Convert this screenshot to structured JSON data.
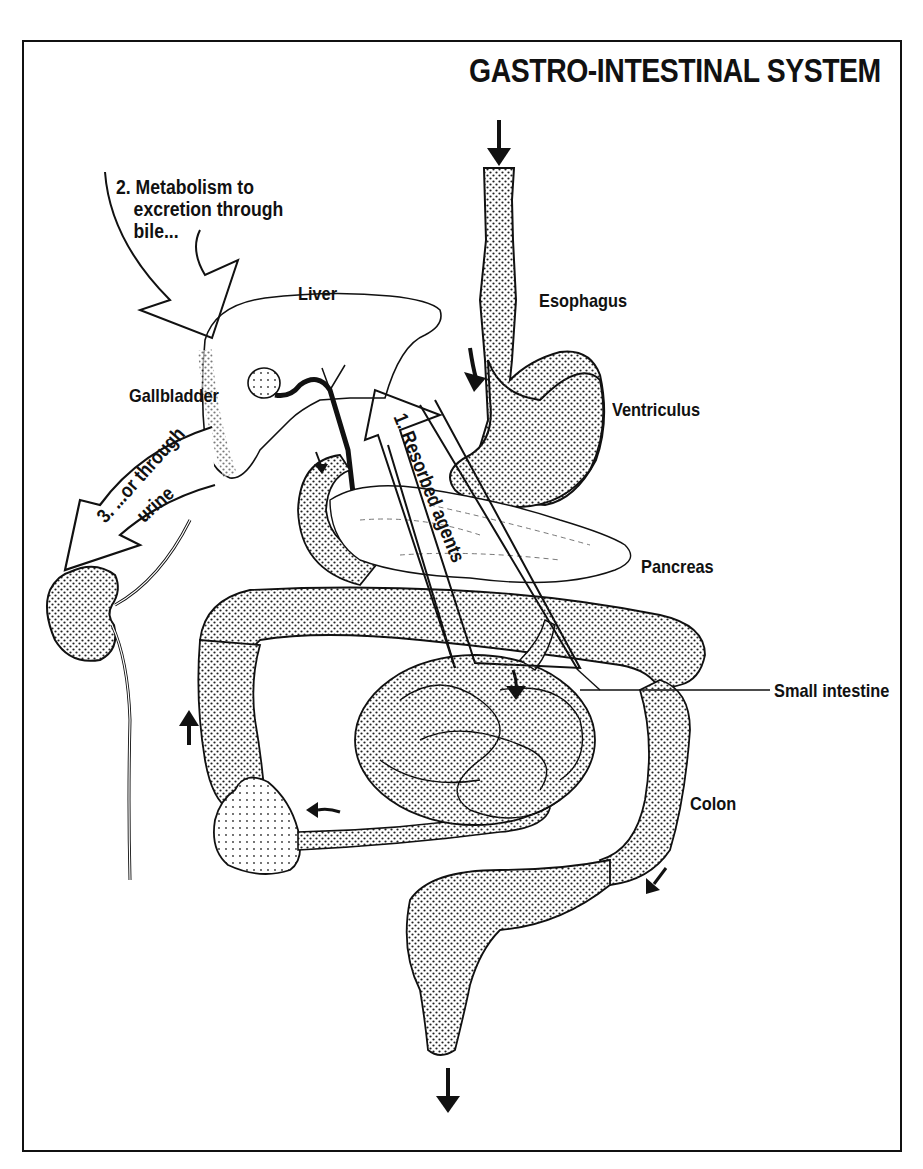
{
  "title": "GASTRO-INTESTINAL SYSTEM",
  "labels": {
    "liver": "Liver",
    "gallbladder": "Gallbladder",
    "esophagus": "Esophagus",
    "ventriculus": "Ventriculus",
    "pancreas": "Pancreas",
    "small_intestine": "Small intestine",
    "colon": "Colon"
  },
  "pathways": {
    "resorbed": "1. Resorbed agents",
    "metabolism_line1": "2. Metabolism to",
    "metabolism_line2": "excretion through",
    "metabolism_line3": "bile...",
    "urine_line1": "3. ...or through",
    "urine_line2": "urine"
  },
  "icons": {
    "flow_arrows": [
      "arrow-down-esophagus",
      "arrow-into-stomach",
      "arrow-duodenum",
      "arrow-jejunum",
      "arrow-ascending-colon-up",
      "arrow-ileum-to-cecum",
      "arrow-descending-colon",
      "arrow-down-rectum"
    ]
  },
  "colors": {
    "ink": "#111111",
    "paper": "#ffffff",
    "stipple": "#bdbdbd"
  }
}
